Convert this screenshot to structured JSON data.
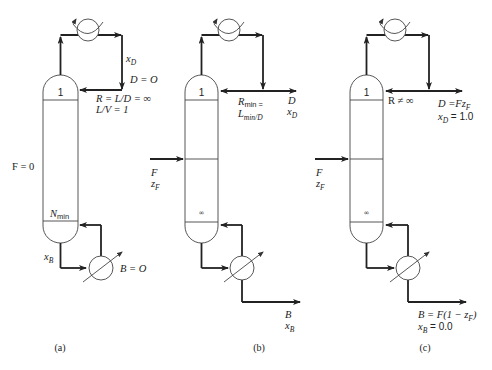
{
  "figure": {
    "panels": [
      {
        "id": "a",
        "caption": "(a)",
        "feed_label": "F = 0",
        "top_tray": "1",
        "bottom_tray_N": "N",
        "bottom_tray_sub": "min",
        "distillate_comp": "x",
        "distillate_comp_sub": "D",
        "distillate_flow": "D = O",
        "reflux_line1": "R = L/D = ∞",
        "reflux_line2": "L/V = 1",
        "bottoms_comp": "x",
        "bottoms_comp_sub": "B",
        "bottoms_flow": "B = O"
      },
      {
        "id": "b",
        "caption": "(b)",
        "feed_F": "F",
        "feed_z": "z",
        "feed_z_sub": "F",
        "top_tray": "1",
        "bottom_tray": "∞",
        "reflux_R": "R",
        "reflux_R_sub": "min =",
        "reflux_L": "L",
        "reflux_L_sub": "min/D",
        "distillate_D": "D",
        "distillate_x": "x",
        "distillate_x_sub": "D",
        "bottoms_B": "B",
        "bottoms_x": "x",
        "bottoms_x_sub": "B"
      },
      {
        "id": "c",
        "caption": "(c)",
        "feed_F": "F",
        "feed_z": "z",
        "feed_z_sub": "F",
        "top_tray": "1",
        "bottom_tray": "∞",
        "reflux": "R ≠ ∞",
        "distillate_flow": "D =Fz",
        "distillate_flow_sub": "F",
        "distillate_x": "x",
        "distillate_x_sub": "D",
        "distillate_x_val": " = 1.0",
        "bottoms_flow": "B = F(1 − z",
        "bottoms_flow_sub": "F",
        "bottoms_flow_end": ")",
        "bottoms_x": "x",
        "bottoms_x_sub": "B",
        "bottoms_x_val": " = 0.0"
      }
    ]
  }
}
